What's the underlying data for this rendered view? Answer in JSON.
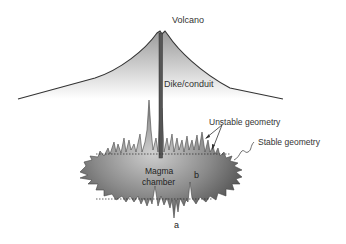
{
  "diagram": {
    "labels": {
      "volcano": "Volcano",
      "dike": "Dike/conduit",
      "unstable": "Unstable geometry",
      "stable": "Stable geometry",
      "chamber_line1": "Magma",
      "chamber_line2": "chamber",
      "point_a": "a",
      "point_b": "b"
    },
    "colors": {
      "volcano_fill_top": "#9a9a9a",
      "volcano_fill_bottom": "#ffffff",
      "chamber_fill_center": "#c8c8c8",
      "chamber_fill_edge": "#5a5a5a",
      "outline": "#333333",
      "text": "#333333"
    }
  }
}
